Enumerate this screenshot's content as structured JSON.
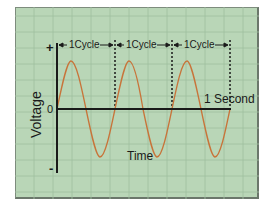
{
  "diagram": {
    "y_axis_label": "Voltage",
    "x_axis_label": "Time",
    "y_positive": "+",
    "y_zero": "0",
    "y_negative": "-",
    "cycles": [
      {
        "label": "1Cycle"
      },
      {
        "label": "1Cycle"
      },
      {
        "label": "1Cycle"
      }
    ],
    "duration_label": "1 Second",
    "colors": {
      "background": "#b9d6b7",
      "grid": "#9fbf9e",
      "wave": "#c8743a",
      "axis": "#1a1a1a"
    }
  }
}
